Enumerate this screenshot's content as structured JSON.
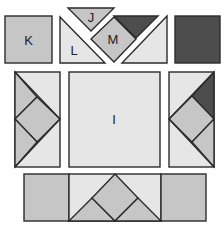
{
  "colors": {
    "light": "#e6e6e6",
    "medium": "#c6c6c6",
    "dark": "#4d4d4d",
    "outline": "#2b2b2b"
  },
  "pieces": {
    "K": {
      "label": "K",
      "shape": "square"
    },
    "J": {
      "label": "J",
      "shape": "triangle"
    },
    "L": {
      "label": "L",
      "shape": "triangle"
    },
    "M": {
      "label": "M",
      "shape": "diamond"
    },
    "I": {
      "label": "I",
      "shape": "square"
    }
  },
  "rows": {
    "top": [
      "K square",
      "L triangle",
      "J triangle",
      "M diamond",
      "dark triangle",
      "light triangle",
      "dark square"
    ],
    "middle": [
      "left panel (diamond pattern)",
      "I square",
      "right panel (diamond pattern with dark corner)"
    ],
    "bottom": [
      "medium square",
      "triangle-diamond strip",
      "medium square"
    ]
  }
}
